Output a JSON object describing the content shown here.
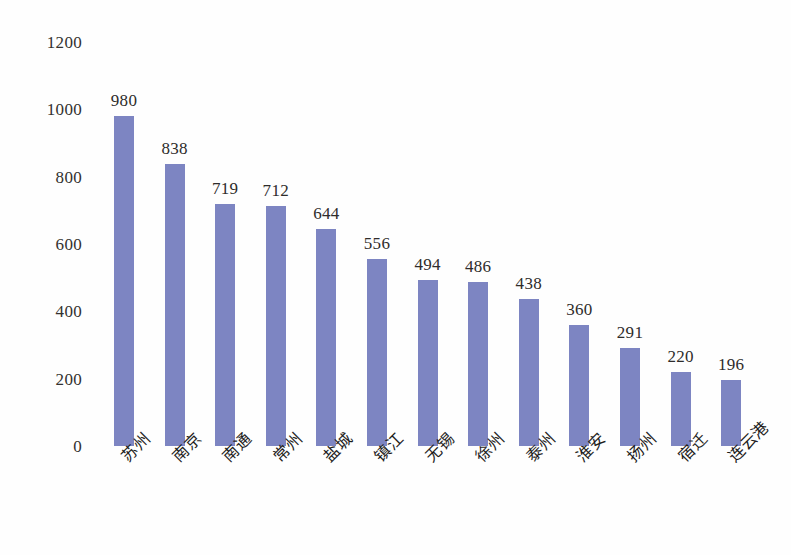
{
  "chart_data": {
    "type": "bar",
    "title": "",
    "subtitle": "",
    "xlabel": "",
    "ylabel": "",
    "legend": [],
    "legend_position": "none",
    "grid": false,
    "axis_lines_visible": false,
    "ylim": [
      0,
      1200
    ],
    "ytick_step": 200,
    "yticks": [
      "1200",
      "1000",
      "800",
      "600",
      "400",
      "200",
      "0"
    ],
    "ytick_values": [
      1200,
      1000,
      800,
      600,
      400,
      200,
      0
    ],
    "categories": [
      "苏州",
      "南京",
      "南通",
      "常州",
      "盐城",
      "镇江",
      "无锡",
      "徐州",
      "泰州",
      "淮安",
      "扬州",
      "宿迁",
      "连云港"
    ],
    "values": [
      980,
      838,
      719,
      712,
      644,
      556,
      494,
      486,
      438,
      360,
      291,
      220,
      196
    ],
    "value_labels": [
      "980",
      "838",
      "719",
      "712",
      "644",
      "556",
      "494",
      "486",
      "438",
      "360",
      "291",
      "220",
      "196"
    ],
    "category_label_rotation_deg": -45,
    "bar_color": "#7d85c2",
    "text_color": "#2b2b2b",
    "background_color": "#ffffff"
  }
}
